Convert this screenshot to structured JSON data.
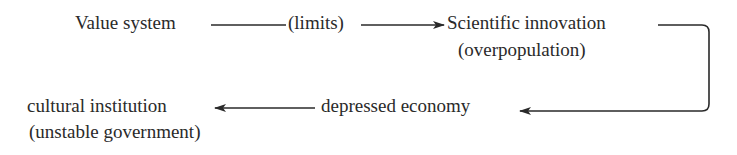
{
  "diagram": {
    "nodes": {
      "value_system": "Value system",
      "limits": "(limits)",
      "scientific_innovation": "Scientific innovation",
      "overpopulation": "(overpopulation)",
      "depressed_economy": "depressed economy",
      "cultural_institution": "cultural institution",
      "unstable_government": "(unstable government)"
    },
    "edges": [
      {
        "from": "value_system",
        "to": "scientific_innovation",
        "label": "(limits)"
      },
      {
        "from": "scientific_innovation",
        "to": "depressed_economy"
      },
      {
        "from": "depressed_economy",
        "to": "cultural_institution"
      }
    ],
    "colors": {
      "ink": "#2a2a2a",
      "background": "#ffffff"
    }
  }
}
